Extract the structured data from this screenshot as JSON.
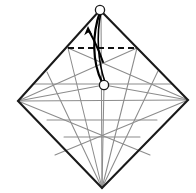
{
  "figure": {
    "canvas": {
      "width": 196,
      "height": 193,
      "background": "#ffffff"
    },
    "colors": {
      "outline": "#1a1a1a",
      "crease": "#8c8c8c",
      "crease_light": "#a6a6a6",
      "dashed": "#111111",
      "arrow": "#000000",
      "marker_fill": "#ffffff",
      "marker_stroke": "#1a1a1a"
    },
    "vertices": {
      "top": {
        "label": "top-apex",
        "x": 100,
        "y": 10
      },
      "left": {
        "label": "left-corner",
        "x": 18,
        "y": 101
      },
      "right": {
        "label": "right-corner",
        "x": 188,
        "y": 100
      },
      "bottom": {
        "label": "bottom-point",
        "x": 102,
        "y": 188
      },
      "inner": {
        "label": "inner-pivot",
        "x": 104,
        "y": 85
      }
    },
    "outline": {
      "name": "diamond-outline",
      "points": "100,10 188,100 102,188 18,101",
      "stroke_width": 2.1
    },
    "dashed_line": {
      "name": "valley-fold-dashed-line",
      "x1": 68,
      "y1": 48,
      "x2": 137,
      "y2": 48,
      "stroke_width": 1.9,
      "dash": "6,4"
    },
    "markers": [
      {
        "name": "top-vertex-marker",
        "cx": 100,
        "cy": 10,
        "r": 4.6
      },
      {
        "name": "inner-vertex-marker",
        "cx": 104,
        "cy": 85,
        "r": 4.6
      }
    ],
    "arrow": {
      "name": "fold-direction-arrow",
      "bow_outer": "M 100,12 C 92,34 92,62 102,82",
      "bow_inner": "M 101,12 C 96,36 98,62 105,82",
      "tail": "M 103,62 C 98,48 93,38 89,31",
      "head_points": "88,26 84.2,35.2 88.1,32.6 92.3,34.8",
      "stroke_width": 2.0
    },
    "creases": [
      {
        "name": "crease-vertical-axis",
        "x1": 101,
        "y1": 10,
        "x2": 102,
        "y2": 188
      },
      {
        "name": "crease-horizontal-mid",
        "x1": 18,
        "y1": 101,
        "x2": 188,
        "y2": 100
      },
      {
        "name": "crease-left-to-inner",
        "x1": 18,
        "y1": 101,
        "x2": 104,
        "y2": 85
      },
      {
        "name": "crease-right-to-inner",
        "x1": 188,
        "y1": 100,
        "x2": 104,
        "y2": 85
      },
      {
        "name": "crease-inner-to-bottom",
        "x1": 104,
        "y1": 85,
        "x2": 102,
        "y2": 188
      },
      {
        "name": "crease-left-diag-down",
        "x1": 18,
        "y1": 101,
        "x2": 150,
        "y2": 155
      },
      {
        "name": "crease-right-diag-down",
        "x1": 188,
        "y1": 100,
        "x2": 55,
        "y2": 155
      },
      {
        "name": "crease-left-long-diag",
        "x1": 18,
        "y1": 101,
        "x2": 137,
        "y2": 48
      },
      {
        "name": "crease-right-long-diag",
        "x1": 188,
        "y1": 100,
        "x2": 68,
        "y2": 48
      },
      {
        "name": "crease-bottom-to-dash-left",
        "x1": 102,
        "y1": 188,
        "x2": 68,
        "y2": 48
      },
      {
        "name": "crease-bottom-to-dash-right",
        "x1": 102,
        "y1": 188,
        "x2": 137,
        "y2": 48
      },
      {
        "name": "crease-bottom-to-left-edge-mid",
        "x1": 102,
        "y1": 188,
        "x2": 47,
        "y2": 72
      },
      {
        "name": "crease-bottom-to-right-edge-mid",
        "x1": 102,
        "y1": 188,
        "x2": 158,
        "y2": 71
      },
      {
        "name": "crease-horizontal-row-1",
        "x1": 47,
        "y1": 120,
        "x2": 157,
        "y2": 120
      },
      {
        "name": "crease-horizontal-row-2",
        "x1": 64,
        "y1": 137,
        "x2": 140,
        "y2": 137
      },
      {
        "name": "crease-horizontal-row-0",
        "x1": 33,
        "y1": 84,
        "x2": 172,
        "y2": 84
      }
    ]
  }
}
